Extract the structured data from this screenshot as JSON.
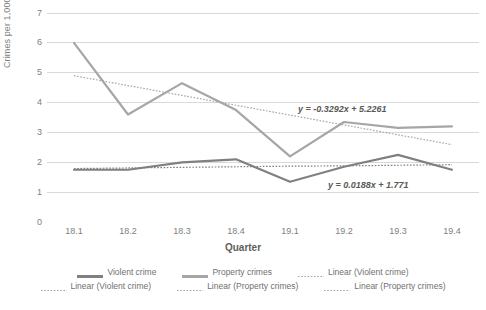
{
  "chart_data": {
    "type": "line",
    "title": "",
    "xlabel": "Quarter",
    "ylabel": "Crimes per 1,000 persons",
    "categories": [
      "18.1",
      "18.2",
      "18.3",
      "18.4",
      "19.1",
      "19.2",
      "19.3",
      "19.4"
    ],
    "ylim": [
      0,
      7
    ],
    "y_ticks": [
      "0",
      "1",
      "2",
      "3",
      "4",
      "5",
      "6",
      "7"
    ],
    "grid": true,
    "legend_position": "bottom",
    "series": [
      {
        "name": "Violent crime",
        "style": "solid",
        "color": "#808080",
        "values": [
          1.75,
          1.75,
          2.0,
          2.1,
          1.35,
          1.85,
          2.25,
          1.75
        ]
      },
      {
        "name": "Property crimes",
        "style": "solid",
        "color": "#a6a6a6",
        "values": [
          6.0,
          3.6,
          4.65,
          3.75,
          2.2,
          3.35,
          3.15,
          3.2
        ]
      },
      {
        "name": "Linear (Violent crime)",
        "style": "dotted",
        "color": "#808080",
        "values": [
          1.79,
          1.81,
          1.83,
          1.85,
          1.87,
          1.88,
          1.9,
          1.92
        ]
      },
      {
        "name": "Linear (Property crimes)",
        "style": "dotted",
        "color": "#a6a6a6",
        "values": [
          4.9,
          4.57,
          4.24,
          3.91,
          3.58,
          3.25,
          2.92,
          2.59
        ]
      }
    ],
    "annotations": [
      {
        "id": "property-trendline-equation",
        "text": "y = -0.3292x + 5.2261"
      },
      {
        "id": "violent-trendline-equation",
        "text": "y = 0.0188x + 1.771"
      }
    ],
    "legend": {
      "rows": [
        [
          {
            "label": "Violent crime",
            "style": "solid",
            "color": "#808080",
            "width": 3
          },
          {
            "label": "Property crimes",
            "style": "solid",
            "color": "#a6a6a6",
            "width": 3
          },
          {
            "label": "Linear (Violent crime)",
            "style": "dotted",
            "color": "#a6a6a6",
            "width": 1
          }
        ],
        [
          {
            "label": "Linear (Violent crime)",
            "style": "dotted",
            "color": "#a6a6a6",
            "width": 1
          },
          {
            "label": "Linear (Property crimes)",
            "style": "dotted",
            "color": "#a6a6a6",
            "width": 1
          },
          {
            "label": "Linear (Property crimes)",
            "style": "dotted",
            "color": "#a6a6a6",
            "width": 1
          }
        ]
      ]
    },
    "colors": {
      "violent": "#808080",
      "property": "#a6a6a6",
      "grid": "#d9d9d9",
      "text": "#808080",
      "annotation": "#595959"
    }
  }
}
